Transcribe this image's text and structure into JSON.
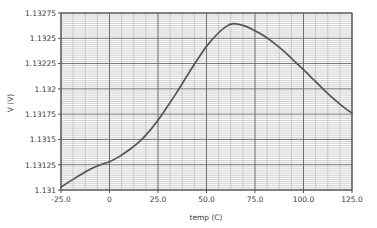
{
  "figure": {
    "background_color": "#ffffff",
    "plot_background_color": "#fdfdfd",
    "frame_color": "#555555",
    "grid_major_color": "#6e6e6e",
    "grid_minor_color": "#b4b4b4",
    "curve_color": "#555555",
    "text_color": "#3a3a3a"
  },
  "chart_data": {
    "type": "line",
    "title": "",
    "xlabel": "temp (C)",
    "ylabel": "V (V)",
    "xlim": [
      -25.0,
      125.0
    ],
    "ylim": [
      1.131,
      1.13275
    ],
    "grid": true,
    "grid_minor": true,
    "legend": "none",
    "xticks": [
      -25.0,
      0,
      25.0,
      50.0,
      75.0,
      100.0,
      125.0
    ],
    "xtick_labels": [
      "-25.0",
      "0",
      "25.0",
      "50.0",
      "75.0",
      "100.0",
      "125.0"
    ],
    "yticks": [
      1.131,
      1.13125,
      1.1315,
      1.13175,
      1.132,
      1.13225,
      1.1325,
      1.13275
    ],
    "ytick_labels": [
      "1.131",
      "1.13125",
      "1.1315",
      "1.13175",
      "1.132",
      "1.13225",
      "1.1325",
      "1.13275"
    ],
    "x_minor_step": 6.25,
    "y_minor_step": 2.083e-05,
    "series": [
      {
        "name": "V vs temp",
        "x": [
          -25,
          -20,
          -15,
          -10,
          -5,
          0,
          5,
          10,
          15,
          20,
          25,
          30,
          35,
          40,
          45,
          50,
          55,
          60,
          64,
          70,
          75,
          80,
          85,
          90,
          95,
          100,
          105,
          110,
          115,
          120,
          125
        ],
        "y": [
          1.13103,
          1.13109,
          1.13115,
          1.131205,
          1.131248,
          1.13128,
          1.13133,
          1.131395,
          1.13147,
          1.13157,
          1.13169,
          1.13183,
          1.131975,
          1.13213,
          1.13228,
          1.13242,
          1.13253,
          1.132615,
          1.132645,
          1.13262,
          1.132575,
          1.13252,
          1.13245,
          1.13237,
          1.13228,
          1.13219,
          1.132095,
          1.132,
          1.13191,
          1.13183,
          1.13176
        ]
      }
    ],
    "annotations": {
      "peak_x": 64,
      "peak_y": 1.132645
    }
  },
  "icons": {}
}
